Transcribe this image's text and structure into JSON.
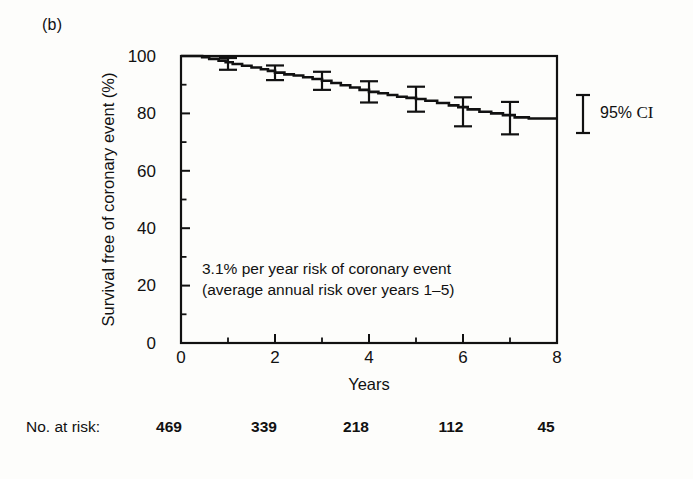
{
  "panel": {
    "label": "(b)"
  },
  "legend": {
    "symbol": "error-bar",
    "prefix": "95% ",
    "ci": "CI",
    "full": "95% CI"
  },
  "annotation": {
    "line1": "3.1% per year risk of coronary event",
    "line2": "(average annual risk over years 1–5)"
  },
  "risk_table": {
    "label": "No. at risk:",
    "values": [
      "469",
      "339",
      "218",
      "112",
      "45"
    ]
  },
  "chart_data": {
    "type": "line",
    "title": "",
    "xlabel": "Years",
    "ylabel": "Survival free of coronary event (%)",
    "xlim": [
      0,
      8
    ],
    "ylim": [
      0,
      100
    ],
    "xticks": [
      0,
      2,
      4,
      6,
      8
    ],
    "xtick_labels": [
      "0",
      "2",
      "4",
      "6",
      "8"
    ],
    "xminor_ticks": [
      1,
      3,
      5,
      7
    ],
    "yticks": [
      0,
      20,
      40,
      60,
      80,
      100
    ],
    "ytick_labels": [
      "0",
      "20",
      "40",
      "60",
      "80",
      "100"
    ],
    "yminor_ticks": [
      10,
      30,
      50,
      70,
      90
    ],
    "grid": false,
    "legend_position": "right-outside",
    "series": [
      {
        "name": "Survival free of coronary event",
        "step": true,
        "x": [
          0.0,
          0.3,
          0.45,
          0.6,
          0.8,
          0.95,
          1.1,
          1.3,
          1.5,
          1.7,
          1.85,
          2.0,
          2.2,
          2.4,
          2.6,
          2.8,
          3.0,
          3.2,
          3.4,
          3.6,
          3.8,
          4.0,
          4.2,
          4.4,
          4.6,
          4.8,
          5.0,
          5.2,
          5.45,
          5.7,
          5.9,
          6.1,
          6.35,
          6.6,
          6.85,
          7.1,
          7.4,
          8.0
        ],
        "y": [
          100.0,
          100.0,
          99.6,
          99.0,
          98.4,
          97.8,
          97.2,
          96.6,
          96.0,
          95.4,
          94.8,
          94.2,
          93.6,
          93.2,
          92.6,
          92.0,
          91.4,
          90.6,
          89.8,
          89.0,
          88.2,
          87.5,
          87.0,
          86.4,
          85.8,
          85.4,
          85.0,
          84.4,
          83.6,
          82.8,
          82.2,
          81.4,
          80.6,
          80.0,
          79.4,
          78.6,
          78.2,
          78.2
        ]
      }
    ],
    "error_bars": [
      {
        "x": 1,
        "y": 97.2,
        "low": 95.2,
        "high": 99.3
      },
      {
        "x": 2,
        "y": 94.2,
        "low": 91.6,
        "high": 96.7
      },
      {
        "x": 3,
        "y": 91.4,
        "low": 88.2,
        "high": 94.5
      },
      {
        "x": 4,
        "y": 87.5,
        "low": 83.8,
        "high": 91.2
      },
      {
        "x": 5,
        "y": 85.0,
        "low": 80.6,
        "high": 89.3
      },
      {
        "x": 6,
        "y": 80.6,
        "low": 75.5,
        "high": 85.6
      },
      {
        "x": 7,
        "y": 78.4,
        "low": 72.7,
        "high": 84.0
      }
    ],
    "annotations": [
      {
        "text": "3.1% per year risk of coronary event",
        "x": 0.45,
        "y": 26
      },
      {
        "text": "(average annual risk over years 1–5)",
        "x": 0.45,
        "y": 19
      }
    ]
  },
  "colors": {
    "ink": "#111111",
    "background": "#fdfdfb"
  }
}
